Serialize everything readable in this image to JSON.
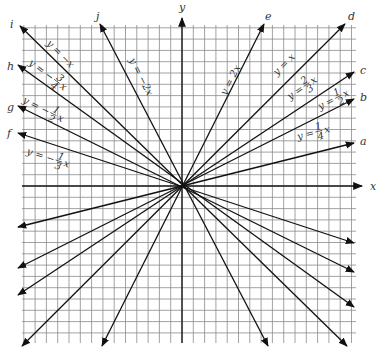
{
  "figure": {
    "width": 386,
    "height": 356,
    "origin_px": [
      182,
      186
    ],
    "grid": {
      "left": 22,
      "right": 356,
      "top": 25,
      "bottom": 343,
      "spacing": 11.3,
      "color": "#8a8a8a"
    },
    "axes": {
      "x_label": "x",
      "y_label": "y",
      "x_arrow_tip": [
        362,
        186
      ],
      "y_arrow_tip": [
        182,
        18
      ],
      "x_label_pos": [
        370,
        190
      ],
      "y_label_pos": [
        179,
        11
      ]
    },
    "lines": [
      {
        "id": "a",
        "equation": "y = 1/4 x",
        "slope": 0.25,
        "end_pos": [
          354,
          143
        ],
        "end_neg": [
          18,
          227
        ],
        "label_pos": [
          360,
          145
        ],
        "eq_pos": [
          298,
          140
        ],
        "eq_angle": -14
      },
      {
        "id": "b",
        "equation": "y = 1/2 x",
        "slope": 0.5,
        "end_pos": [
          354,
          99
        ],
        "end_neg": [
          18,
          268
        ],
        "label_pos": [
          360,
          101
        ],
        "eq_pos": [
          320,
          110
        ],
        "eq_angle": -27
      },
      {
        "id": "c",
        "equation": "y = 2/3 x",
        "slope": 0.6667,
        "end_pos": [
          354,
          72
        ],
        "end_neg": [
          18,
          295
        ],
        "label_pos": [
          360,
          74
        ],
        "eq_pos": [
          290,
          100
        ],
        "eq_angle": -34
      },
      {
        "id": "d",
        "equation": "y = x",
        "slope": 1,
        "end_pos": [
          345,
          24
        ],
        "end_neg": [
          22,
          346
        ],
        "label_pos": [
          348,
          20
        ],
        "eq_pos": [
          277,
          76
        ],
        "eq_angle": -45
      },
      {
        "id": "e",
        "equation": "y = 2x",
        "slope": 2,
        "end_pos": [
          264,
          24
        ],
        "end_neg": [
          102,
          346
        ],
        "label_pos": [
          265,
          20
        ],
        "eq_pos": [
          226,
          96
        ],
        "eq_angle": -63
      },
      {
        "id": "j",
        "equation": "y = -2x",
        "slope": -2,
        "end_pos": [
          268,
          346
        ],
        "end_neg": [
          100,
          24
        ],
        "label_pos": [
          96,
          20
        ],
        "eq_pos": [
          129,
          60
        ],
        "eq_angle": 63
      },
      {
        "id": "i",
        "equation": "y = -x",
        "slope": -1,
        "end_pos": [
          347,
          346
        ],
        "end_neg": [
          20,
          26
        ],
        "label_pos": [
          10,
          28
        ],
        "eq_pos": [
          46,
          44
        ],
        "eq_angle": 45
      },
      {
        "id": "h",
        "equation": "y = -3/4 x",
        "slope": -0.75,
        "end_pos": [
          354,
          307
        ],
        "end_neg": [
          18,
          65
        ],
        "label_pos": [
          7,
          70
        ],
        "eq_pos": [
          28,
          64
        ],
        "eq_angle": 37
      },
      {
        "id": "g",
        "equation": "y = -1/2 x",
        "slope": -0.5,
        "end_pos": [
          354,
          272
        ],
        "end_neg": [
          18,
          106
        ],
        "label_pos": [
          7,
          111
        ],
        "eq_pos": [
          22,
          102
        ],
        "eq_angle": 27
      },
      {
        "id": "f",
        "equation": "y = -1/3 x",
        "slope": -0.3333,
        "end_pos": [
          354,
          243
        ],
        "end_neg": [
          18,
          133
        ],
        "label_pos": [
          7,
          137
        ],
        "eq_pos": [
          26,
          154
        ],
        "eq_angle": 18
      }
    ],
    "equation_labels": {
      "a": {
        "lhs": "y =",
        "num": "1",
        "den": "4",
        "var": "x"
      },
      "b": {
        "lhs": "y =",
        "num": "1",
        "den": "2",
        "var": "x"
      },
      "c": {
        "lhs": "y =",
        "num": "2",
        "den": "3",
        "var": "x"
      },
      "d": {
        "lhs": "y = x"
      },
      "e": {
        "lhs": "y = 2x"
      },
      "j": {
        "lhs": "y = −2x"
      },
      "i": {
        "lhs": "y = −x"
      },
      "h": {
        "lhs": "y = −",
        "num": "3",
        "den": "4",
        "var": "x"
      },
      "g": {
        "lhs": "y = −",
        "num": "1",
        "den": "2",
        "var": "x"
      },
      "f": {
        "lhs": "y = −",
        "num": "1",
        "den": "3",
        "var": "x"
      }
    }
  }
}
